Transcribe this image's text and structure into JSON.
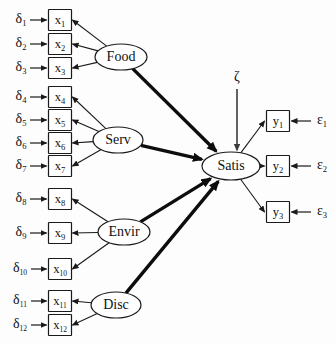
{
  "diagram": {
    "type": "structural-equation-model-path-diagram",
    "title": "",
    "background_color": "#fdfdfd",
    "line_color": "#1a1a1a"
  },
  "indicators": [
    {
      "id": "x1",
      "label": "x",
      "sub": "1",
      "error": "δ",
      "error_sub": "1",
      "x": 60,
      "y": 20
    },
    {
      "id": "x2",
      "label": "x",
      "sub": "2",
      "error": "δ",
      "error_sub": "2",
      "x": 60,
      "y": 44
    },
    {
      "id": "x3",
      "label": "x",
      "sub": "3",
      "error": "δ",
      "error_sub": "3",
      "x": 60,
      "y": 68
    },
    {
      "id": "x4",
      "label": "x",
      "sub": "4",
      "error": "δ",
      "error_sub": "4",
      "x": 60,
      "y": 97
    },
    {
      "id": "x5",
      "label": "x",
      "sub": "5",
      "error": "δ",
      "error_sub": "5",
      "x": 60,
      "y": 120
    },
    {
      "id": "x6",
      "label": "x",
      "sub": "6",
      "error": "δ",
      "error_sub": "6",
      "x": 60,
      "y": 143
    },
    {
      "id": "x7",
      "label": "x",
      "sub": "7",
      "error": "δ",
      "error_sub": "7",
      "x": 60,
      "y": 166
    },
    {
      "id": "x8",
      "label": "x",
      "sub": "8",
      "error": "δ",
      "error_sub": "8",
      "x": 60,
      "y": 199
    },
    {
      "id": "x9",
      "label": "x",
      "sub": "9",
      "error": "δ",
      "error_sub": "9",
      "x": 60,
      "y": 233
    },
    {
      "id": "x10",
      "label": "x",
      "sub": "10",
      "error": "δ",
      "error_sub": "10",
      "x": 60,
      "y": 269
    },
    {
      "id": "x11",
      "label": "x",
      "sub": "11",
      "error": "δ",
      "error_sub": "11",
      "x": 60,
      "y": 301
    },
    {
      "id": "x12",
      "label": "x",
      "sub": "12",
      "error": "δ",
      "error_sub": "12",
      "x": 60,
      "y": 325
    }
  ],
  "outcomes": [
    {
      "id": "y1",
      "label": "y",
      "sub": "1",
      "error": "ε",
      "error_sub": "1",
      "x": 278,
      "y": 121
    },
    {
      "id": "y2",
      "label": "y",
      "sub": "2",
      "error": "ε",
      "error_sub": "2",
      "x": 278,
      "y": 166
    },
    {
      "id": "y3",
      "label": "y",
      "sub": "3",
      "error": "ε",
      "error_sub": "3",
      "x": 278,
      "y": 212
    }
  ],
  "latents": [
    {
      "id": "food",
      "label": "Food",
      "x": 121,
      "y": 57,
      "rx": 26,
      "ry": 13,
      "indicators": [
        "x1",
        "x2",
        "x3"
      ]
    },
    {
      "id": "serv",
      "label": "Serv",
      "x": 118,
      "y": 140,
      "rx": 25,
      "ry": 13,
      "indicators": [
        "x4",
        "x5",
        "x6",
        "x7"
      ]
    },
    {
      "id": "envir",
      "label": "Envir",
      "x": 124,
      "y": 232,
      "rx": 26,
      "ry": 13,
      "indicators": [
        "x8",
        "x9",
        "x10"
      ]
    },
    {
      "id": "disc",
      "label": "Disc",
      "x": 116,
      "y": 305,
      "rx": 25,
      "ry": 13,
      "indicators": [
        "x11",
        "x12"
      ]
    }
  ],
  "endogenous": {
    "id": "satis",
    "label": "Satis",
    "x": 231,
    "y": 166,
    "rx": 29,
    "ry": 14,
    "outcomes": [
      "y1",
      "y2",
      "y3"
    ]
  },
  "disturbance": {
    "id": "zeta",
    "label": "ζ",
    "x": 237,
    "y": 78
  },
  "structural_paths": [
    {
      "from": "food",
      "to": "satis",
      "weight": "thick"
    },
    {
      "from": "serv",
      "to": "satis",
      "weight": "thick"
    },
    {
      "from": "envir",
      "to": "satis",
      "weight": "thick"
    },
    {
      "from": "disc",
      "to": "satis",
      "weight": "thick"
    }
  ],
  "legend": {
    "delta_symbol": "δ",
    "epsilon_symbol": "ε",
    "zeta_symbol": "ζ"
  }
}
